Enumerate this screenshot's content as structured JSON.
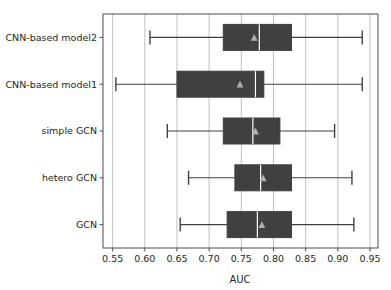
{
  "chart_data": {
    "type": "box",
    "orientation": "horizontal",
    "title": "",
    "xlabel": "AUC",
    "ylabel": "",
    "xlim": [
      0.535,
      0.9625
    ],
    "xticks": [
      0.55,
      0.6,
      0.65,
      0.7,
      0.75,
      0.8,
      0.85,
      0.9,
      0.95
    ],
    "xtick_labels": [
      "0.55",
      "0.60",
      "0.65",
      "0.70",
      "0.75",
      "0.80",
      "0.85",
      "0.90",
      "0.95"
    ],
    "categories": [
      "GCN",
      "hetero GCN",
      "simple GCN",
      "CNN-based model1",
      "CNN-based model2"
    ],
    "grid": true,
    "grid_axis": "x",
    "legend": "none",
    "box_color": "#404040",
    "line_color": "#404040",
    "median_color": "#ffffff",
    "mean_marker": "triangle",
    "mean_marker_color": "#b0b0b0",
    "boxes": [
      {
        "label": "GCN",
        "whisker_low": 0.655,
        "q1": 0.728,
        "median": 0.775,
        "q3": 0.828,
        "whisker_high": 0.925,
        "mean": 0.782
      },
      {
        "label": "hetero GCN",
        "whisker_low": 0.668,
        "q1": 0.74,
        "median": 0.78,
        "q3": 0.828,
        "whisker_high": 0.922,
        "mean": 0.784
      },
      {
        "label": "simple GCN",
        "whisker_low": 0.635,
        "q1": 0.722,
        "median": 0.768,
        "q3": 0.81,
        "whisker_high": 0.895,
        "mean": 0.772
      },
      {
        "label": "CNN-based model1",
        "whisker_low": 0.555,
        "q1": 0.65,
        "median": 0.772,
        "q3": 0.785,
        "whisker_high": 0.938,
        "mean": 0.748
      },
      {
        "label": "CNN-based model2",
        "whisker_low": 0.608,
        "q1": 0.722,
        "median": 0.778,
        "q3": 0.828,
        "whisker_high": 0.938,
        "mean": 0.77
      }
    ]
  },
  "axes": {
    "xlabel": "AUC"
  }
}
